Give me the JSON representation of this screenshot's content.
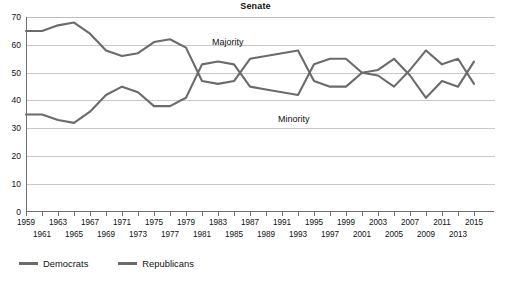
{
  "chart_data": {
    "type": "line",
    "title": "Senate",
    "xlabel": "",
    "ylabel": "",
    "ylim": [
      0,
      70
    ],
    "ytick_step": 10,
    "yticks": [
      70,
      60,
      50,
      40,
      30,
      20,
      10,
      0
    ],
    "grid": true,
    "legend_position": "bottom-left",
    "x": [
      1959,
      1961,
      1963,
      1965,
      1967,
      1969,
      1971,
      1973,
      1975,
      1977,
      1979,
      1981,
      1983,
      1985,
      1987,
      1989,
      1991,
      1993,
      1995,
      1997,
      1999,
      2001,
      2003,
      2005,
      2007,
      2009,
      2011,
      2013,
      2015
    ],
    "xtick_labels_row1": [
      "1959",
      "1963",
      "1967",
      "1971",
      "1975",
      "1979",
      "1983",
      "1987",
      "1991",
      "1995",
      "1999",
      "2003",
      "2007",
      "2011",
      "2015"
    ],
    "xtick_labels_row2": [
      "1961",
      "1965",
      "1969",
      "1973",
      "1977",
      "1981",
      "1985",
      "1989",
      "1993",
      "1997",
      "2001",
      "2005",
      "2009",
      "2013"
    ],
    "series": [
      {
        "name": "Democrats",
        "color": "#6b6b6b",
        "values": [
          65,
          65,
          67,
          68,
          64,
          58,
          56,
          57,
          61,
          62,
          59,
          47,
          46,
          47,
          55,
          56,
          57,
          58,
          47,
          45,
          45,
          50,
          49,
          45,
          51,
          58,
          53,
          55,
          46
        ]
      },
      {
        "name": "Republicans",
        "color": "#6b6b6b",
        "values": [
          35,
          35,
          33,
          32,
          36,
          42,
          45,
          43,
          38,
          38,
          41,
          53,
          54,
          53,
          45,
          44,
          43,
          42,
          53,
          55,
          55,
          50,
          51,
          55,
          49,
          41,
          47,
          45,
          54
        ]
      }
    ],
    "annotations": [
      {
        "text": "Majority",
        "x": 1991,
        "y": 62
      },
      {
        "text": "Minority",
        "x": 1997,
        "y": 38
      }
    ]
  },
  "legend": {
    "items": [
      {
        "label": "Democrats",
        "color": "#6b6b6b"
      },
      {
        "label": "Republicans",
        "color": "#6b6b6b"
      }
    ]
  },
  "colors": {
    "grid": "#c8c8c8",
    "axis": "#6f6f6f",
    "line": "#6b6b6b",
    "text": "#111111",
    "background": "#ffffff"
  }
}
